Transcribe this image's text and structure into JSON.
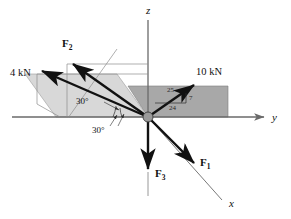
{
  "figure": {
    "background_color": "#ffffff",
    "ink_color": "#111111"
  },
  "axes": [
    {
      "id": "z",
      "label": "z",
      "description": "vertical axis pointing up",
      "label_x": 146,
      "label_y": 14
    },
    {
      "id": "y",
      "label": "y",
      "description": "horizontal axis pointing right",
      "label_x": 272,
      "label_y": 121
    },
    {
      "id": "x",
      "label": "x",
      "description": "oblique axis toward lower right",
      "label_x": 229,
      "label_y": 207
    }
  ],
  "origin": {
    "name": "origin-point",
    "x": 148,
    "y": 117,
    "radius": 5,
    "fill": "#9a9a9a",
    "stroke": "#3a3a3a"
  },
  "planes": [
    {
      "id": "right-plane",
      "description": "darker shaded horizontal plane in the x-y quadrant to the right",
      "fill": "#a8a8a8",
      "stroke": "#7d7d7d",
      "points": "148,117 128,86 228,86 228,117"
    },
    {
      "id": "left-plane",
      "description": "lighter shaded inclined plane containing F2 and the 4 kN force",
      "fill": "#d8d8d8",
      "stroke": "#9c9c9c",
      "points": "148,117 56,117 25,74 117,74"
    }
  ],
  "construction_lines": [
    {
      "id": "cl-plane-diagonal",
      "x1": 68,
      "y1": 118,
      "x2": 117,
      "y2": 49,
      "color": "#8d8d8d"
    },
    {
      "id": "cl-upper-horizontal",
      "x1": 67,
      "y1": 64,
      "x2": 148,
      "y2": 64,
      "color": "#8d8d8d"
    },
    {
      "id": "cl-mid-horizontal",
      "x1": 37,
      "y1": 74,
      "x2": 148,
      "y2": 74,
      "color": "#8d8d8d"
    },
    {
      "id": "cl-vertical-f2",
      "x1": 67,
      "y1": 64,
      "x2": 67,
      "y2": 117,
      "color": "#8d8d8d"
    },
    {
      "id": "cl-vertical-4kn",
      "x1": 37,
      "y1": 74,
      "x2": 37,
      "y2": 104,
      "color": "#8d8d8d"
    },
    {
      "id": "cl-slant-4kn",
      "x1": 37,
      "y1": 104,
      "x2": 60,
      "y2": 117,
      "color": "#8d8d8d"
    },
    {
      "id": "cl-x-extension",
      "x1": 196,
      "y1": 165,
      "x2": 222,
      "y2": 200,
      "color": "#8d8d8d"
    }
  ],
  "forces": [
    {
      "id": "F1",
      "label": "F",
      "subscript": "1",
      "label_x": 200,
      "label_y": 166,
      "description": "force directed down along the positive x axis",
      "x1": 148,
      "y1": 117,
      "x2": 196,
      "y2": 165
    },
    {
      "id": "F2",
      "label": "F",
      "subscript": "2",
      "label_x": 62,
      "label_y": 47,
      "description": "force directed into the upper left in the inclined plane",
      "x1": 148,
      "y1": 117,
      "x2": 71,
      "y2": 62
    },
    {
      "id": "F3",
      "label": "F",
      "subscript": "3",
      "label_x": 155,
      "label_y": 177,
      "description": "force directed straight down the negative z axis",
      "x1": 148,
      "y1": 117,
      "x2": 148,
      "y2": 172
    },
    {
      "id": "F4kN",
      "label": "4 kN",
      "label_x": 10,
      "label_y": 76,
      "description": "4 kN force directed to the upper left",
      "x1": 148,
      "y1": 117,
      "x2": 40,
      "y2": 70
    },
    {
      "id": "F10kN",
      "label": "10 kN",
      "label_x": 196,
      "label_y": 75,
      "description": "10 kN force directed to the upper right in the horizontal plane",
      "x1": 148,
      "y1": 117,
      "x2": 196,
      "y2": 84
    }
  ],
  "angles": [
    {
      "id": "angle-upper",
      "label": "30°",
      "label_x": 90,
      "label_y": 100,
      "description": "angle between the 4 kN force and the horizontal"
    },
    {
      "id": "angle-lower",
      "label": "30°",
      "label_x": 95,
      "label_y": 128,
      "description": "angle between the projection and the y axis"
    }
  ],
  "ratio_triangle": {
    "id": "slope-triangle-10kn",
    "description": "7-24-25 slope triangle on the 10 kN force",
    "hypotenuse_label": "25",
    "hypotenuse_x": 167,
    "hypotenuse_y": 92,
    "vertical_label": "7",
    "vertical_x": 189,
    "vertical_y": 100,
    "horizontal_label": "24",
    "horizontal_x": 172,
    "horizontal_y": 106,
    "vertical_line": {
      "x1": 186,
      "y1": 93,
      "x2": 186,
      "y2": 103
    },
    "horizontal_line": {
      "x1": 155,
      "y1": 103,
      "x2": 186,
      "y2": 103
    }
  }
}
